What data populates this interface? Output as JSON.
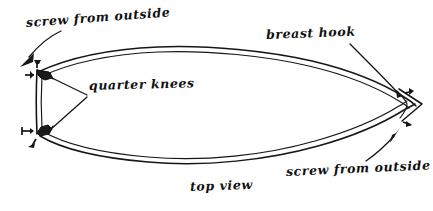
{
  "diagram": {
    "title": "top view",
    "ink_color": "#161616",
    "background_color": "#ffffff"
  },
  "labels": {
    "screw_top": "screw from outside",
    "quarter_knees": "quarter knees",
    "breast_hook": "breast hook",
    "screw_bottom": "screw from outside",
    "top_view": "top view"
  },
  "parts": [
    {
      "name": "transom",
      "position": "left"
    },
    {
      "name": "quarter-knee-upper",
      "position": "left-top-corner"
    },
    {
      "name": "quarter-knee-lower",
      "position": "left-bottom-corner"
    },
    {
      "name": "breast-hook",
      "position": "bow-point-right"
    },
    {
      "name": "hull-planking",
      "position": "perimeter"
    }
  ],
  "annotations": {
    "arrow_count": 2,
    "leader_line_count": 3,
    "screw_tick_count": 4
  }
}
